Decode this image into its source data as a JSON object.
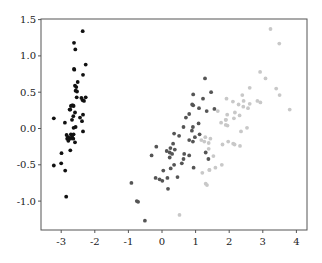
{
  "chart_data": {
    "type": "scatter",
    "title": "",
    "xlabel": "",
    "ylabel": "",
    "xlim": [
      -3.6,
      4.3
    ],
    "ylim": [
      -1.4,
      1.5
    ],
    "grid": false,
    "legend": null,
    "x_ticks": [
      -3,
      -2,
      -1,
      0,
      1,
      2,
      3,
      4
    ],
    "x_tick_labels": [
      "-3",
      "-2",
      "-1",
      "0",
      "1",
      "2",
      "3",
      "4"
    ],
    "y_ticks": [
      -1.0,
      -0.5,
      0.0,
      0.5,
      1.0,
      1.5
    ],
    "y_tick_labels": [
      "-1.0",
      "-0.5",
      "0.0",
      "0.5",
      "1.0",
      "1.5"
    ],
    "series": [
      {
        "name": "class-0",
        "color": "#111111",
        "points": [
          [
            -2.36,
            1.34
          ],
          [
            -2.62,
            1.18
          ],
          [
            -2.58,
            1.09
          ],
          [
            -2.62,
            0.82
          ],
          [
            -2.61,
            0.81
          ],
          [
            -2.27,
            0.88
          ],
          [
            -2.35,
            0.74
          ],
          [
            -2.51,
            0.64
          ],
          [
            -2.59,
            0.59
          ],
          [
            -2.55,
            0.57
          ],
          [
            -2.57,
            0.52
          ],
          [
            -2.53,
            0.51
          ],
          [
            -2.4,
            0.42
          ],
          [
            -2.27,
            0.43
          ],
          [
            -2.54,
            0.43
          ],
          [
            -2.36,
            0.39
          ],
          [
            -2.32,
            0.38
          ],
          [
            -2.65,
            0.32
          ],
          [
            -2.68,
            0.32
          ],
          [
            -2.63,
            0.31
          ],
          [
            -2.71,
            0.31
          ],
          [
            -2.73,
            0.26
          ],
          [
            -2.75,
            0.26
          ],
          [
            -2.59,
            0.22
          ],
          [
            -3.22,
            0.14
          ],
          [
            -2.35,
            0.19
          ],
          [
            -2.44,
            0.15
          ],
          [
            -2.64,
            0.17
          ],
          [
            -2.68,
            0.12
          ],
          [
            -2.89,
            0.08
          ],
          [
            -2.38,
            0.1
          ],
          [
            -2.57,
            0.02
          ],
          [
            -2.63,
            0.01
          ],
          [
            -2.35,
            -0.04
          ],
          [
            -2.71,
            -0.08
          ],
          [
            -2.84,
            -0.09
          ],
          [
            -2.79,
            -0.12
          ],
          [
            -2.63,
            -0.08
          ],
          [
            -2.82,
            -0.14
          ],
          [
            -2.73,
            -0.14
          ],
          [
            -2.79,
            -0.17
          ],
          [
            -2.64,
            -0.14
          ],
          [
            -2.68,
            -0.11
          ],
          [
            -2.59,
            -0.19
          ],
          [
            -2.73,
            -0.3
          ],
          [
            -2.99,
            -0.34
          ],
          [
            -3.22,
            -0.51
          ],
          [
            -3.0,
            -0.48
          ],
          [
            -2.88,
            -0.58
          ],
          [
            -2.85,
            -0.94
          ]
        ]
      },
      {
        "name": "class-1",
        "color": "#555555",
        "points": [
          [
            1.28,
            0.69
          ],
          [
            0.93,
            0.32
          ],
          [
            1.46,
            0.5
          ],
          [
            0.18,
            -0.83
          ],
          [
            1.09,
            0.07
          ],
          [
            0.64,
            -0.42
          ],
          [
            1.1,
            0.28
          ],
          [
            -0.75,
            -1.0
          ],
          [
            0.92,
            0.02
          ],
          [
            0.01,
            -0.72
          ],
          [
            -0.51,
            -1.27
          ],
          [
            0.51,
            -0.1
          ],
          [
            0.26,
            -0.55
          ],
          [
            0.98,
            -0.12
          ],
          [
            -0.17,
            -0.25
          ],
          [
            0.93,
            0.47
          ],
          [
            0.66,
            -0.35
          ],
          [
            0.23,
            -0.33
          ],
          [
            0.94,
            -0.54
          ],
          [
            0.04,
            -0.58
          ],
          [
            1.12,
            -0.08
          ],
          [
            0.36,
            -0.07
          ],
          [
            1.3,
            -0.33
          ],
          [
            0.92,
            -0.18
          ],
          [
            0.71,
            0.15
          ],
          [
            0.9,
            0.33
          ],
          [
            1.33,
            0.24
          ],
          [
            1.56,
            0.27
          ],
          [
            0.81,
            -0.16
          ],
          [
            -0.31,
            -0.37
          ],
          [
            -0.07,
            -0.7
          ],
          [
            -0.19,
            -0.68
          ],
          [
            0.14,
            -0.31
          ],
          [
            1.38,
            -0.42
          ],
          [
            0.59,
            -0.48
          ],
          [
            0.81,
            0.2
          ],
          [
            1.22,
            0.41
          ],
          [
            0.81,
            -0.37
          ],
          [
            0.25,
            -0.27
          ],
          [
            0.16,
            -0.68
          ],
          [
            0.46,
            -0.67
          ],
          [
            0.89,
            -0.03
          ],
          [
            0.23,
            -0.4
          ],
          [
            -0.71,
            -1.01
          ],
          [
            0.36,
            -0.5
          ],
          [
            0.33,
            -0.21
          ],
          [
            0.38,
            -0.29
          ],
          [
            0.64,
            0.02
          ],
          [
            -0.91,
            -0.75
          ],
          [
            0.3,
            -0.35
          ]
        ]
      },
      {
        "name": "class-2",
        "color": "#c8c8c8",
        "points": [
          [
            2.53,
            0.01
          ],
          [
            1.41,
            -0.57
          ],
          [
            2.61,
            0.34
          ],
          [
            1.97,
            -0.18
          ],
          [
            2.35,
            -0.04
          ],
          [
            3.4,
            0.55
          ],
          [
            0.52,
            -1.19
          ],
          [
            2.93,
            0.36
          ],
          [
            2.32,
            -0.24
          ],
          [
            2.92,
            0.78
          ],
          [
            1.66,
            0.24
          ],
          [
            1.8,
            -0.22
          ],
          [
            2.17,
            0.22
          ],
          [
            1.34,
            -0.78
          ],
          [
            1.59,
            -0.54
          ],
          [
            1.9,
            0.12
          ],
          [
            1.95,
            0.04
          ],
          [
            3.49,
            1.17
          ],
          [
            3.8,
            0.26
          ],
          [
            1.3,
            -0.76
          ],
          [
            2.43,
            0.38
          ],
          [
            1.2,
            -0.61
          ],
          [
            3.5,
            0.46
          ],
          [
            1.39,
            -0.2
          ],
          [
            2.28,
            0.33
          ],
          [
            2.61,
            0.56
          ],
          [
            1.26,
            -0.18
          ],
          [
            1.29,
            -0.12
          ],
          [
            2.12,
            -0.21
          ],
          [
            2.39,
            0.46
          ],
          [
            2.84,
            0.38
          ],
          [
            3.23,
            1.37
          ],
          [
            2.16,
            -0.22
          ],
          [
            1.44,
            -0.14
          ],
          [
            1.78,
            -0.5
          ],
          [
            3.08,
            0.69
          ],
          [
            2.14,
            0.14
          ],
          [
            1.9,
            0.05
          ],
          [
            1.17,
            -0.16
          ],
          [
            2.11,
            0.37
          ],
          [
            2.31,
            0.18
          ],
          [
            1.92,
            0.41
          ],
          [
            1.41,
            -0.57
          ],
          [
            2.56,
            0.28
          ],
          [
            2.42,
            0.3
          ],
          [
            1.94,
            0.19
          ],
          [
            1.53,
            -0.38
          ],
          [
            1.76,
            0.08
          ],
          [
            1.9,
            0.12
          ],
          [
            1.39,
            -0.28
          ]
        ]
      }
    ]
  }
}
